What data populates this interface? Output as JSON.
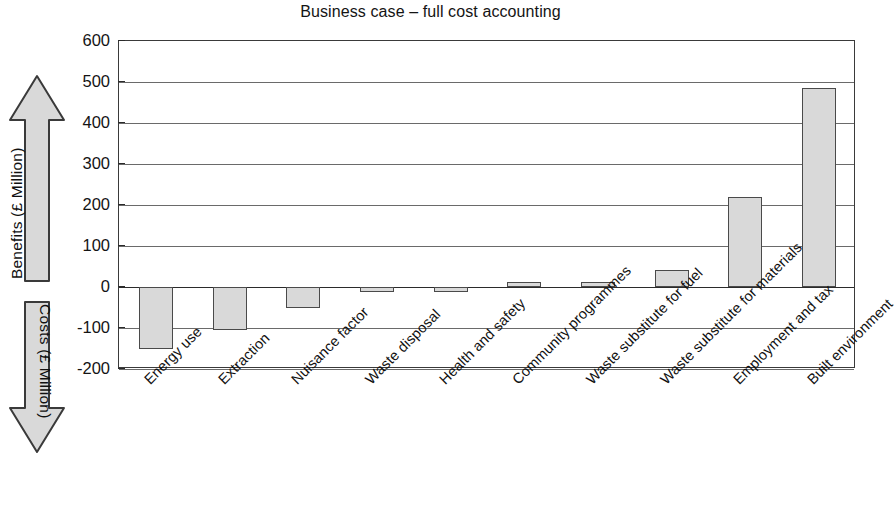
{
  "chart_data": {
    "type": "bar",
    "title": "Business case – full cost accounting",
    "xlabel": "",
    "ylabel": "",
    "ylim": [
      -200,
      600
    ],
    "ytick_step": 100,
    "yticks": [
      "600",
      "500",
      "400",
      "300",
      "200",
      "100",
      "0",
      "-100",
      "-200"
    ],
    "grid": true,
    "legend": "none",
    "categories": [
      "Energy use",
      "Extraction",
      "Nuisance factor",
      "Waste disposal",
      "Health and safety",
      "Community programmes",
      "Waste substitute for fuel",
      "Waste substitute for materials",
      "Employment and tax",
      "Built environment"
    ],
    "values": [
      -150,
      -105,
      -50,
      -12,
      -12,
      12,
      13,
      42,
      220,
      485
    ],
    "bar_fill": "#d9d9d9",
    "bar_border": "#4a4a4a"
  },
  "axis_annotations": {
    "benefits": {
      "label": "Benefits (£ Million)",
      "direction": "up"
    },
    "costs": {
      "label": "Costs (£ Million)",
      "direction": "down"
    }
  }
}
